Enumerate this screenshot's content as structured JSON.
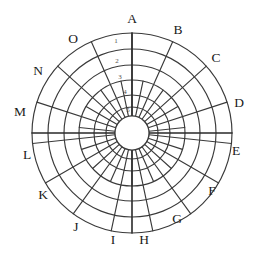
{
  "diagram": {
    "type": "polar-grid",
    "center": {
      "x": 132,
      "y": 133
    },
    "outer_radius": 100,
    "hub_radius": 17,
    "sector_count": 15,
    "sector_span_degrees": 24,
    "ring_count": 6,
    "stroke_color": "#3a3a3a",
    "axis_color": "#2a2a2a",
    "background_color": "#ffffff",
    "sector_labels": [
      {
        "id": "A",
        "label": "A",
        "angle_deg": 0,
        "lx": 132,
        "ly": 20
      },
      {
        "id": "B",
        "label": "B",
        "angle_deg": 24,
        "lx": 178,
        "ly": 31
      },
      {
        "id": "C",
        "label": "C",
        "angle_deg": 48,
        "lx": 216,
        "ly": 59
      },
      {
        "id": "D",
        "label": "D",
        "angle_deg": 72,
        "lx": 239,
        "ly": 104
      },
      {
        "id": "E",
        "label": "E",
        "angle_deg": 96,
        "lx": 236,
        "ly": 152
      },
      {
        "id": "F",
        "label": "F",
        "angle_deg": 120,
        "lx": 212,
        "ly": 192
      },
      {
        "id": "G",
        "label": "G",
        "angle_deg": 144,
        "lx": 177,
        "ly": 220
      },
      {
        "id": "H",
        "label": "H",
        "angle_deg": 168,
        "lx": 144,
        "ly": 241
      },
      {
        "id": "I",
        "label": "I",
        "angle_deg": 192,
        "lx": 113,
        "ly": 241
      },
      {
        "id": "J",
        "label": "J",
        "angle_deg": 216,
        "lx": 76,
        "ly": 228
      },
      {
        "id": "K",
        "label": "K",
        "angle_deg": 240,
        "lx": 43,
        "ly": 196
      },
      {
        "id": "L",
        "label": "L",
        "angle_deg": 264,
        "lx": 27,
        "ly": 156
      },
      {
        "id": "M",
        "label": "M",
        "angle_deg": 288,
        "lx": 20,
        "ly": 113
      },
      {
        "id": "N",
        "label": "N",
        "angle_deg": 312,
        "lx": 38,
        "ly": 72
      },
      {
        "id": "O",
        "label": "O",
        "angle_deg": 336,
        "lx": 73,
        "ly": 40
      }
    ],
    "ring_labels": [
      {
        "id": "1",
        "label": "1",
        "lx": 116,
        "ly": 41
      },
      {
        "id": "2",
        "label": "2",
        "lx": 117,
        "ly": 61
      },
      {
        "id": "3",
        "label": "3",
        "lx": 120,
        "ly": 77
      },
      {
        "id": "4",
        "label": "4",
        "lx": 125,
        "ly": 92
      },
      {
        "id": "5",
        "label": "5",
        "lx": 128,
        "ly": 110
      }
    ],
    "ring_radii": [
      100,
      84,
      68,
      53,
      38,
      26,
      17
    ]
  }
}
